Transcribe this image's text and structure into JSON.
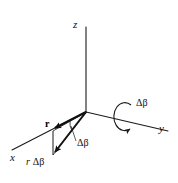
{
  "figure": {
    "kind": "vector-diagram",
    "background_color": "#ffffff",
    "stroke_color": "#1a1a1a",
    "axes": {
      "z_label": "z",
      "y_label": "y",
      "x_label": "x"
    },
    "labels": {
      "vector_r": "r",
      "arc_displacement": "r Δβ",
      "arc_displacement_italic_r": "r",
      "arc_displacement_delta_beta": "Δβ",
      "angle_delta_beta": "Δβ",
      "rotation_delta_beta": "Δβ"
    },
    "geometry": {
      "origin": [
        86,
        112
      ],
      "z_tip": [
        86,
        27
      ],
      "y_tip": [
        168,
        131
      ],
      "x_tip": [
        12,
        150
      ],
      "r_tip": [
        52,
        131
      ],
      "r_rotated_tip": [
        53,
        156
      ],
      "rotation_arrow_center": [
        122,
        116
      ]
    }
  }
}
